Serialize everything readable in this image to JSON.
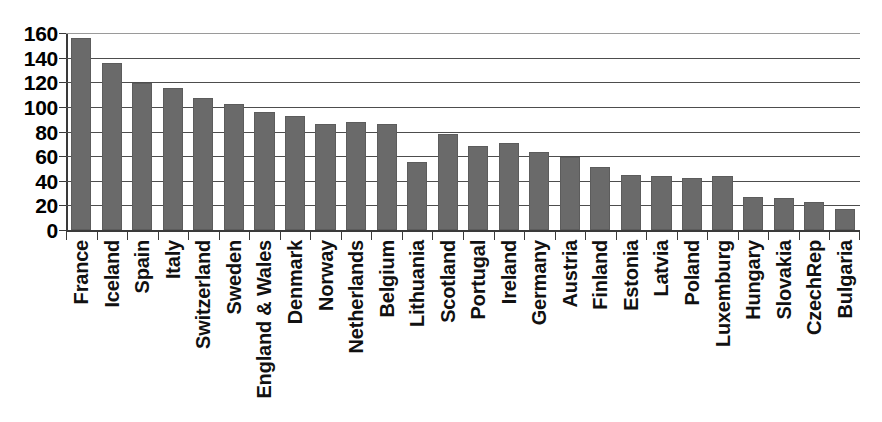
{
  "chart_data": {
    "type": "bar",
    "title": "",
    "subtitle": "",
    "xlabel": "",
    "ylabel": "",
    "ylim": [
      0,
      160
    ],
    "yticks": [
      0,
      20,
      40,
      60,
      80,
      100,
      120,
      140,
      160
    ],
    "ytick_labels": [
      "0",
      "20",
      "40",
      "60",
      "80",
      "100",
      "120",
      "140",
      "160"
    ],
    "grid": true,
    "grid_axis": "y",
    "legend": false,
    "legend_position": "none",
    "orientation": "vertical",
    "bar_color": "#6a6a6a",
    "categories": [
      "France",
      "Iceland",
      "Spain",
      "Italy",
      "Switzerland",
      "Sweden",
      "England & Wales",
      "Denmark",
      "Norway",
      "Netherlands",
      "Belgium",
      "Lithuania",
      "Scotland",
      "Portugal",
      "Ireland",
      "Germany",
      "Austria",
      "Finland",
      "Estonia",
      "Latvia",
      "Poland",
      "Luxemburg",
      "Hungary",
      "Slovakia",
      "CzechRep",
      "Bulgaria"
    ],
    "values": [
      156,
      136,
      119,
      115,
      107,
      102,
      96,
      93,
      86,
      88,
      86,
      55,
      78,
      68,
      71,
      63,
      59,
      51,
      45,
      44,
      42,
      44,
      27,
      26,
      23,
      17
    ]
  }
}
